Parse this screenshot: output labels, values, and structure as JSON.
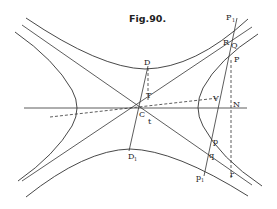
{
  "figure": {
    "title": "Fig.90.",
    "labels": {
      "P1_top": "P",
      "P1_top_sub": "1",
      "R": "R",
      "Q": "Q",
      "P": "P",
      "D": "D",
      "T": "T",
      "V": "V",
      "N": "N",
      "C": "C",
      "t": "t",
      "D1": "D",
      "D1_sub": "1",
      "p": "p",
      "q": "q",
      "p1": "p",
      "p1_sub": "1",
      "r": "r"
    },
    "colors": {
      "ink": "#333333",
      "background": "#ffffff"
    }
  }
}
